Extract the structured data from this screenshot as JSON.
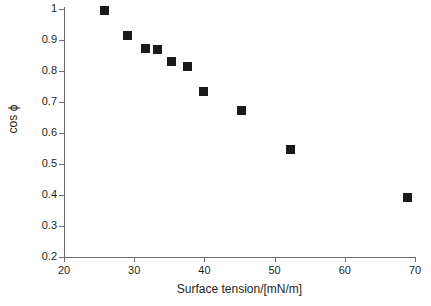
{
  "chart_data": {
    "type": "scatter",
    "title": "",
    "xlabel": "Surface tension/[mN/m]",
    "ylabel": "cos ϕ",
    "xlim": [
      20,
      70
    ],
    "ylim": [
      0.2,
      1.0
    ],
    "grid": false,
    "legend": null,
    "xticks": [
      "20",
      "30",
      "40",
      "50",
      "60",
      "70"
    ],
    "xtick_values": [
      20,
      30,
      40,
      50,
      60,
      70
    ],
    "yticks": [
      "0.2",
      "0.3",
      "0.4",
      "0.5",
      "0.6",
      "0.7",
      "0.8",
      "0.9",
      "1"
    ],
    "ytick_values": [
      0.2,
      0.3,
      0.4,
      0.5,
      0.6,
      0.7,
      0.8,
      0.9,
      1.0
    ],
    "marker": "filled-square",
    "marker_color": "#1a1a1a",
    "axis_color": "#6d6e71",
    "series": [
      {
        "name": "cos ϕ vs surface tension",
        "x": [
          25.7,
          29.1,
          31.6,
          33.3,
          35.3,
          37.6,
          39.9,
          45.3,
          52.3,
          68.9
        ],
        "y": [
          0.995,
          0.916,
          0.873,
          0.87,
          0.832,
          0.813,
          0.734,
          0.672,
          0.547,
          0.391
        ]
      }
    ]
  }
}
